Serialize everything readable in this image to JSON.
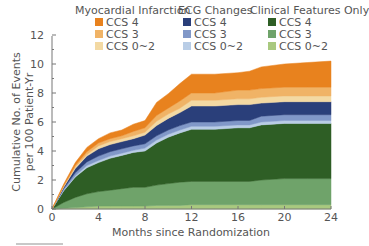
{
  "chart_data": {
    "type": "area",
    "stacked": true,
    "title": "",
    "xlabel": "Months since Randomization",
    "ylabel": "Cumulative No. of Events per 100 Patient-Yr",
    "ylabel_lines": [
      "Cumulative No. of Events",
      "per 100 Patient-Yr"
    ],
    "xlim": [
      0,
      24
    ],
    "ylim": [
      0,
      12
    ],
    "xticks": [
      0,
      4,
      8,
      12,
      16,
      20,
      24
    ],
    "yticks": [
      0,
      2,
      4,
      6,
      8,
      10,
      12
    ],
    "grid": false,
    "legend_position": "top",
    "legend_groups": [
      {
        "title": "Myocardial Infarction",
        "items": [
          "CCS 4",
          "CCS 3",
          "CCS 0~2"
        ]
      },
      {
        "title": "ECG Changes",
        "items": [
          "CCS 4",
          "CCS 3",
          "CCS 0~2"
        ]
      },
      {
        "title": "Clinical Features Only",
        "items": [
          "CCS 4",
          "CCS 3",
          "CCS 0~2"
        ]
      }
    ],
    "x": [
      0,
      1,
      2,
      3,
      4,
      5,
      6,
      7,
      8,
      9,
      10,
      11,
      12,
      14,
      16,
      17,
      18,
      20,
      22,
      24
    ],
    "series": [
      {
        "name": "Clinical Features Only CCS 0~2",
        "color": "#a9c97f",
        "values": [
          0,
          0.05,
          0.1,
          0.15,
          0.2,
          0.2,
          0.2,
          0.2,
          0.2,
          0.25,
          0.25,
          0.25,
          0.3,
          0.3,
          0.3,
          0.3,
          0.3,
          0.3,
          0.3,
          0.3
        ]
      },
      {
        "name": "Clinical Features Only CCS 3",
        "color": "#6fa36a",
        "values": [
          0,
          0.4,
          0.7,
          0.9,
          1.0,
          1.1,
          1.2,
          1.3,
          1.3,
          1.4,
          1.5,
          1.6,
          1.6,
          1.6,
          1.6,
          1.6,
          1.7,
          1.8,
          1.8,
          1.8
        ]
      },
      {
        "name": "Clinical Features Only CCS 4",
        "color": "#2e5e25",
        "values": [
          0,
          0.8,
          1.4,
          1.8,
          2.0,
          2.2,
          2.3,
          2.4,
          2.5,
          2.9,
          3.2,
          3.4,
          3.6,
          3.6,
          3.7,
          3.7,
          3.8,
          3.8,
          3.8,
          3.8
        ]
      },
      {
        "name": "ECG Changes CCS 0~2",
        "color": "#b9cde6",
        "values": [
          0,
          0.05,
          0.1,
          0.15,
          0.15,
          0.15,
          0.15,
          0.15,
          0.2,
          0.2,
          0.2,
          0.2,
          0.2,
          0.2,
          0.2,
          0.2,
          0.2,
          0.2,
          0.2,
          0.2
        ]
      },
      {
        "name": "ECG Changes CCS 3",
        "color": "#8198c8",
        "values": [
          0,
          0.1,
          0.2,
          0.25,
          0.3,
          0.3,
          0.3,
          0.3,
          0.3,
          0.3,
          0.3,
          0.3,
          0.3,
          0.3,
          0.3,
          0.3,
          0.4,
          0.4,
          0.4,
          0.4
        ]
      },
      {
        "name": "ECG Changes CCS 4",
        "color": "#2a3f7a",
        "values": [
          0,
          0.1,
          0.3,
          0.4,
          0.5,
          0.5,
          0.5,
          0.5,
          0.6,
          0.7,
          0.8,
          0.9,
          1.1,
          1.1,
          1.1,
          1.1,
          0.9,
          0.9,
          0.9,
          0.9
        ]
      },
      {
        "name": "Myocardial Infarction CCS 0~2",
        "color": "#f3d9a3",
        "values": [
          0,
          0.05,
          0.1,
          0.1,
          0.2,
          0.2,
          0.2,
          0.2,
          0.2,
          0.3,
          0.3,
          0.3,
          0.4,
          0.4,
          0.4,
          0.4,
          0.4,
          0.4,
          0.4,
          0.4
        ]
      },
      {
        "name": "Myocardial Infarction CCS 3",
        "color": "#f0b366",
        "values": [
          0,
          0.05,
          0.1,
          0.2,
          0.2,
          0.2,
          0.2,
          0.3,
          0.3,
          0.4,
          0.4,
          0.5,
          0.5,
          0.5,
          0.6,
          0.6,
          0.6,
          0.6,
          0.6,
          0.6
        ]
      },
      {
        "name": "Myocardial Infarction CCS 4",
        "color": "#e8821e",
        "values": [
          0,
          0.1,
          0.2,
          0.3,
          0.3,
          0.4,
          0.4,
          0.5,
          0.5,
          0.9,
          1.0,
          1.2,
          1.3,
          1.3,
          1.2,
          1.3,
          1.5,
          1.6,
          1.7,
          1.8
        ]
      }
    ]
  },
  "legend": {
    "groups": [
      {
        "title": "Myocardial Infarction",
        "items": [
          {
            "label": "CCS 4",
            "color": "#e8821e"
          },
          {
            "label": "CCS 3",
            "color": "#f0b366"
          },
          {
            "label": "CCS 0~2",
            "color": "#f3d9a3"
          }
        ]
      },
      {
        "title": "ECG Changes",
        "items": [
          {
            "label": "CCS 4",
            "color": "#2a3f7a"
          },
          {
            "label": "CCS 3",
            "color": "#8198c8"
          },
          {
            "label": "CCS 0~2",
            "color": "#b9cde6"
          }
        ]
      },
      {
        "title": "Clinical Features Only",
        "items": [
          {
            "label": "CCS 4",
            "color": "#2e5e25"
          },
          {
            "label": "CCS 3",
            "color": "#6fa36a"
          },
          {
            "label": "CCS 0~2",
            "color": "#a9c97f"
          }
        ]
      }
    ]
  },
  "axes": {
    "xlabel": "Months since Randomization",
    "ylabel_line1": "Cumulative No. of Events",
    "ylabel_line2": "per 100 Patient-Yr",
    "xticks": [
      "0",
      "4",
      "8",
      "12",
      "16",
      "20",
      "24"
    ],
    "yticks": [
      "0",
      "2",
      "4",
      "6",
      "8",
      "10",
      "12"
    ]
  }
}
